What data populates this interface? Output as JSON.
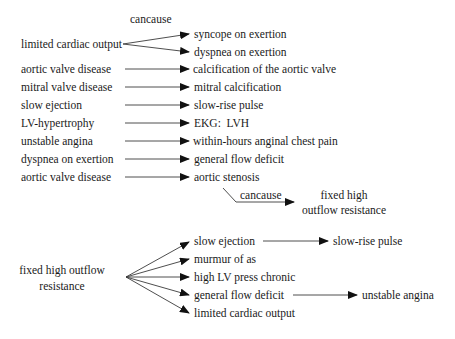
{
  "diagram": {
    "colors": {
      "line": "#3a3a3a",
      "arrowhead": "#111111",
      "text": "#1a1a1a",
      "background": "#ffffff"
    },
    "top_block": {
      "fork_label": "cancause",
      "fork_source": "limited cardiac output",
      "fork_targets": [
        "syncope on exertion",
        "dyspnea on exertion"
      ],
      "rows": [
        {
          "source": "aortic valve disease",
          "target": "calcification of the aortic valve"
        },
        {
          "source": "mitral valve disease",
          "target": "mitral calcification"
        },
        {
          "source": "slow ejection",
          "target": "slow-rise pulse"
        },
        {
          "source": "LV-hypertrophy",
          "target": "EKG:  LVH"
        },
        {
          "source": "unstable angina",
          "target": "within-hours anginal chest pain"
        },
        {
          "source": "dyspnea on exertion",
          "target": "general flow deficit"
        },
        {
          "source": "aortic valve disease",
          "target": "aortic stenosis"
        }
      ],
      "stenosis_link": {
        "label": "cancause",
        "target_line1": "fixed high",
        "target_line2": "outflow resistance"
      }
    },
    "bottom_block": {
      "source_line1": "fixed high outflow",
      "source_line2": "resistance",
      "targets": [
        "slow ejection",
        "murmur of as",
        "high LV press chronic",
        "general flow deficit",
        "limited cardiac output"
      ],
      "chains": [
        {
          "from": "slow ejection",
          "to": "slow-rise pulse"
        },
        {
          "from": "general flow deficit",
          "to": "unstable angina"
        }
      ]
    }
  }
}
